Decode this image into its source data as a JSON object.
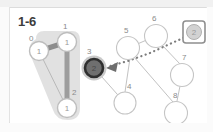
{
  "panel": {
    "title": "1-6",
    "background": "#ffffff",
    "frame_color": "#e3e3e3"
  },
  "colors": {
    "node_stroke": "#b5b5b5",
    "node_fill": "#ffffff",
    "label_text": "#8a8a8a",
    "edge": "#c2c2c2",
    "cluster_fill": "#dcdcdc",
    "highlight_edge": "#8d8d8d",
    "selected_node_ring": "#2f2f2f",
    "selected_node_halo": "#bfbfbf",
    "pointer_arrow": "#6e6e6e",
    "dotted_path": "#7d7d7d",
    "box_stroke": "#9a9a9a"
  },
  "graph": {
    "cluster": {
      "name": "left-cluster-highlight",
      "members": [
        "0",
        "1",
        "2"
      ],
      "fill": "#dcdcdc"
    },
    "nodes": [
      {
        "id": "0",
        "label": "0",
        "value": "1",
        "cx": 29,
        "cy": 43,
        "r": 9.5,
        "state": "clustered",
        "label_dx": -8,
        "label_dy": -11
      },
      {
        "id": "1",
        "label": "1",
        "value": "1",
        "cx": 57,
        "cy": 34,
        "r": 9.5,
        "state": "clustered",
        "label_dx": -2,
        "label_dy": -13
      },
      {
        "id": "2",
        "label": "2",
        "value": "1",
        "cx": 57,
        "cy": 100,
        "r": 9.5,
        "state": "clustered",
        "label_dx": 8,
        "label_dy": -13
      },
      {
        "id": "3",
        "label": "3",
        "value": "2",
        "cx": 84,
        "cy": 60,
        "r": 9.0,
        "state": "selected",
        "label_dx": -5,
        "label_dy": -14
      },
      {
        "id": "4",
        "label": "4",
        "value": "",
        "cx": 115,
        "cy": 95,
        "r": 11.0,
        "state": "normal",
        "label_dx": 3,
        "label_dy": -14
      },
      {
        "id": "5",
        "label": "5",
        "value": "",
        "cx": 118,
        "cy": 40,
        "r": 11.5,
        "state": "normal",
        "label_dx": -2,
        "label_dy": -15
      },
      {
        "id": "6",
        "label": "6",
        "value": "",
        "cx": 146,
        "cy": 28,
        "r": 11.5,
        "state": "normal",
        "label_dx": -2,
        "label_dy": -15
      },
      {
        "id": "7",
        "label": "7",
        "value": "",
        "cx": 172,
        "cy": 67,
        "r": 11.5,
        "state": "normal",
        "label_dx": 2,
        "label_dy": -15
      },
      {
        "id": "8",
        "label": "8",
        "value": "",
        "cx": 166,
        "cy": 105,
        "r": 11.5,
        "state": "normal",
        "label_dx": -1,
        "label_dy": -15
      }
    ],
    "edges": [
      {
        "from": "0",
        "to": "1",
        "style": "thick-dark"
      },
      {
        "from": "1",
        "to": "2",
        "style": "thick-grey"
      },
      {
        "from": "0",
        "to": "2",
        "style": "thin"
      },
      {
        "from": "3",
        "to": "4",
        "style": "thin"
      },
      {
        "from": "5",
        "to": "6",
        "style": "thin"
      },
      {
        "from": "5",
        "to": "4",
        "style": "thin"
      },
      {
        "from": "5",
        "to": "8",
        "style": "thin"
      },
      {
        "from": "6",
        "to": "7",
        "style": "thin"
      },
      {
        "from": "7",
        "to": "8",
        "style": "thin"
      }
    ],
    "dotted_path": {
      "name": "dotted-pointer-path",
      "points": "182,26 160,36 138,46 116,53 98,58",
      "arrow_at": "3",
      "style": "dotted"
    },
    "boxed_node": {
      "name": "boxed-node",
      "value": "2",
      "x": 173,
      "y": 13,
      "w": 22,
      "h": 22,
      "circle_r": 7.5
    }
  }
}
